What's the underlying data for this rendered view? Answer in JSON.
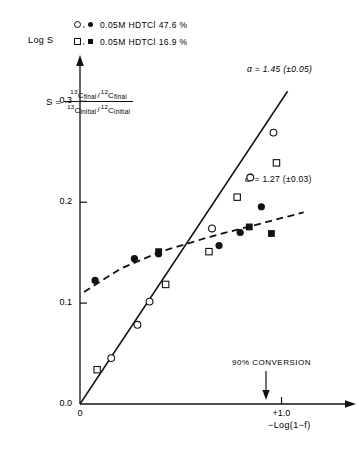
{
  "legend": {
    "rows": [
      {
        "symbols": [
          "open-circle",
          "filled-circle"
        ],
        "label": "0.05M HDTCl  47.6 %"
      },
      {
        "symbols": [
          "open-square",
          "filled-square"
        ],
        "label": "0.05M HDTCl  16.9 %"
      }
    ]
  },
  "equation": {
    "lhs": "S =",
    "numerator": {
      "iso1": "13",
      "c1": "C",
      "sub1": "final",
      "slash": "/",
      "iso2": "12",
      "c2": "C",
      "sub2": "final"
    },
    "denominator": {
      "iso1": "13",
      "c1": "C",
      "sub1": "initial",
      "slash": "/",
      "iso2": "12",
      "c2": "C",
      "sub2": "initial"
    }
  },
  "annotations": {
    "alpha_solid": "α = 1.45 (±0.05)",
    "alpha_dashed_symbol": "α",
    "alpha_dashed_prime": "′",
    "alpha_dashed_value": "= 1.27 (±0.03)",
    "conversion": "90% CONVERSION"
  },
  "chart_data": {
    "type": "scatter",
    "title": "",
    "xlabel": "−Log(1−f)",
    "ylabel": "Log S",
    "xlim": [
      0,
      1.32
    ],
    "ylim": [
      0,
      0.335
    ],
    "grid": false,
    "legend_position": "above-plot",
    "xticks": [
      {
        "value": 0,
        "label": "0"
      },
      {
        "value": 1.0,
        "label": "+1.0"
      }
    ],
    "yticks": [
      {
        "value": 0.0,
        "label": "0.0"
      },
      {
        "value": 0.1,
        "label": "0.1"
      },
      {
        "value": 0.2,
        "label": "0.2"
      },
      {
        "value": 0.3,
        "label": "0.3"
      }
    ],
    "series": [
      {
        "name": "0.05M HDTCl 47.6 % (open circle)",
        "marker": "open-circle",
        "points": [
          {
            "x": 0.155,
            "y": 0.0455
          },
          {
            "x": 0.285,
            "y": 0.0785
          },
          {
            "x": 0.345,
            "y": 0.1015
          },
          {
            "x": 0.655,
            "y": 0.174
          },
          {
            "x": 0.845,
            "y": 0.2245
          },
          {
            "x": 0.96,
            "y": 0.269
          }
        ]
      },
      {
        "name": "0.05M HDTCl 47.6 % (filled circle)",
        "marker": "filled-circle",
        "points": [
          {
            "x": 0.075,
            "y": 0.1225
          },
          {
            "x": 0.27,
            "y": 0.144
          },
          {
            "x": 0.39,
            "y": 0.149
          },
          {
            "x": 0.69,
            "y": 0.157
          },
          {
            "x": 0.795,
            "y": 0.17
          },
          {
            "x": 0.9,
            "y": 0.1955
          }
        ]
      },
      {
        "name": "0.05M HDTCl 16.9 % (open square)",
        "marker": "open-square",
        "points": [
          {
            "x": 0.085,
            "y": 0.034
          },
          {
            "x": 0.425,
            "y": 0.1185
          },
          {
            "x": 0.64,
            "y": 0.151
          },
          {
            "x": 0.78,
            "y": 0.205
          },
          {
            "x": 0.975,
            "y": 0.239
          }
        ]
      },
      {
        "name": "0.05M HDTCl 16.9 % (filled square)",
        "marker": "filled-square",
        "points": [
          {
            "x": 0.39,
            "y": 0.151
          },
          {
            "x": 0.84,
            "y": 0.1755
          },
          {
            "x": 0.95,
            "y": 0.169
          }
        ]
      }
    ],
    "fits": [
      {
        "name": "alpha-line",
        "style": "solid",
        "label": "α = 1.45 (±0.05)",
        "x0": 0.0,
        "y0": 0.0,
        "x1": 1.03,
        "y1": 0.31
      },
      {
        "name": "alpha-prime-curve",
        "style": "dashed",
        "label": "α′ = 1.27 (±0.03)",
        "points": [
          {
            "x": 0.02,
            "y": 0.111
          },
          {
            "x": 0.2,
            "y": 0.134
          },
          {
            "x": 0.4,
            "y": 0.151
          },
          {
            "x": 0.65,
            "y": 0.166
          },
          {
            "x": 0.9,
            "y": 0.179
          },
          {
            "x": 1.11,
            "y": 0.19
          }
        ]
      }
    ],
    "markers_annotation": {
      "conversion_x": 1.0,
      "conversion_label": "90% CONVERSION"
    }
  }
}
